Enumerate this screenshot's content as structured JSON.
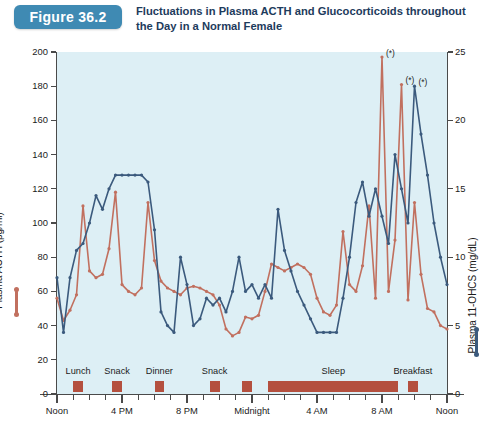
{
  "figure": {
    "badge": "Figure 36.2",
    "title": "Fluctuations in Plasma ACTH and Glucocorticoids throughout the Day in a Normal Female",
    "badge_color": "#3f8ab3",
    "plot_background": "#ddeff5"
  },
  "chart_data": {
    "type": "line",
    "title": "Fluctuations in Plasma ACTH and Glucocorticoids throughout the Day in a Normal Female",
    "xlabel": "",
    "ylabel": "Plasma ACTH (pg/ml)",
    "y2label": "Plasma 11-OHCS (mg/dL)",
    "grid": false,
    "legend_position": "axis-titles",
    "xlim": [
      12,
      36
    ],
    "ylim": [
      0,
      200
    ],
    "y2lim": [
      0,
      25
    ],
    "yticks": [
      0,
      20,
      40,
      60,
      80,
      100,
      120,
      140,
      160,
      180,
      200
    ],
    "y2ticks": [
      0,
      5,
      10,
      15,
      20,
      25
    ],
    "xtick_labels": [
      "Noon",
      "4 PM",
      "8 PM",
      "Midnight",
      "4 AM",
      "8 AM",
      "Noon"
    ],
    "xtick_hours": [
      12,
      16,
      20,
      24,
      28,
      32,
      36
    ],
    "xtick_minor_interval_hours": 1,
    "series": [
      {
        "name": "Plasma ACTH (pg/ml)",
        "color": "#c1705f",
        "axis": "left",
        "x": [
          12.0,
          12.4,
          12.8,
          13.2,
          13.6,
          14.0,
          14.4,
          14.8,
          15.2,
          15.6,
          16.0,
          16.4,
          16.8,
          17.2,
          17.6,
          18.0,
          18.4,
          18.8,
          19.2,
          19.6,
          20.0,
          20.4,
          20.8,
          21.2,
          21.6,
          22.0,
          22.4,
          22.8,
          23.2,
          23.6,
          24.0,
          24.4,
          24.8,
          25.2,
          25.6,
          26.0,
          26.4,
          26.8,
          27.2,
          27.6,
          28.0,
          28.4,
          28.8,
          29.2,
          29.6,
          30.0,
          30.4,
          30.8,
          31.2,
          31.6,
          32.0,
          32.4,
          32.8,
          33.2,
          33.6,
          34.0,
          34.4,
          34.8,
          35.2,
          35.6,
          36.0
        ],
        "values": [
          56,
          43,
          49,
          58,
          110,
          72,
          68,
          70,
          85,
          118,
          64,
          60,
          58,
          62,
          112,
          78,
          66,
          62,
          60,
          58,
          62,
          63,
          62,
          60,
          58,
          52,
          38,
          34,
          36,
          45,
          44,
          46,
          60,
          76,
          74,
          72,
          74,
          76,
          74,
          70,
          56,
          48,
          46,
          52,
          95,
          64,
          60,
          75,
          110,
          56,
          197,
          60,
          90,
          181,
          55,
          112,
          70,
          50,
          48,
          40,
          38
        ]
      },
      {
        "name": "Plasma 11-OHCS (mg/dL)",
        "color": "#3b5a7d",
        "axis": "right",
        "x": [
          12.0,
          12.4,
          12.8,
          13.2,
          13.6,
          14.0,
          14.4,
          14.8,
          15.2,
          15.6,
          16.0,
          16.4,
          16.8,
          17.2,
          17.6,
          18.0,
          18.4,
          18.8,
          19.2,
          19.6,
          20.0,
          20.4,
          20.8,
          21.2,
          21.6,
          22.0,
          22.4,
          22.8,
          23.2,
          23.6,
          24.0,
          24.4,
          24.8,
          25.2,
          25.6,
          26.0,
          26.4,
          26.8,
          27.2,
          27.6,
          28.0,
          28.4,
          28.8,
          29.2,
          29.6,
          30.0,
          30.4,
          30.8,
          31.2,
          31.6,
          32.0,
          32.4,
          32.8,
          33.2,
          33.6,
          34.0,
          34.4,
          34.8,
          35.2,
          35.6,
          36.0
        ],
        "values": [
          8.5,
          4.5,
          8.5,
          10.5,
          11.0,
          12.5,
          14.5,
          13.5,
          15.0,
          16.0,
          16.0,
          16.0,
          16.0,
          16.0,
          15.5,
          12.0,
          6.0,
          5.0,
          4.5,
          10.0,
          8.0,
          5.0,
          5.5,
          7.0,
          6.5,
          7.0,
          6.0,
          7.5,
          10.0,
          7.5,
          8.0,
          7.0,
          8.0,
          7.0,
          13.5,
          10.5,
          9.0,
          7.5,
          6.5,
          5.5,
          4.5,
          4.5,
          4.5,
          4.5,
          7.0,
          10.0,
          14.0,
          15.5,
          13.0,
          15.0,
          13.0,
          11.0,
          17.5,
          15.0,
          12.5,
          22.5,
          19.0,
          16.0,
          12.5,
          10.0,
          8.0
        ]
      }
    ],
    "annotations": [
      {
        "label": "(*)",
        "x": 32.0,
        "y_left": 197
      },
      {
        "label": "(*)",
        "x": 33.2,
        "y_left": 181
      },
      {
        "label": "(*)",
        "x": 34.0,
        "y_right": 22.5
      }
    ],
    "event_bars": [
      {
        "label": "Lunch",
        "start_hour": 13.0,
        "end_hour": 13.6
      },
      {
        "label": "Snack",
        "start_hour": 15.4,
        "end_hour": 16.0
      },
      {
        "label": "Dinner",
        "start_hour": 18.0,
        "end_hour": 18.6
      },
      {
        "label": "Snack",
        "start_hour": 21.4,
        "end_hour": 22.0
      },
      {
        "label": "",
        "start_hour": 23.4,
        "end_hour": 24.0
      },
      {
        "label": "Sleep",
        "start_hour": 25.0,
        "end_hour": 33.0
      },
      {
        "label": "Breakfast",
        "start_hour": 33.6,
        "end_hour": 34.2
      }
    ]
  }
}
